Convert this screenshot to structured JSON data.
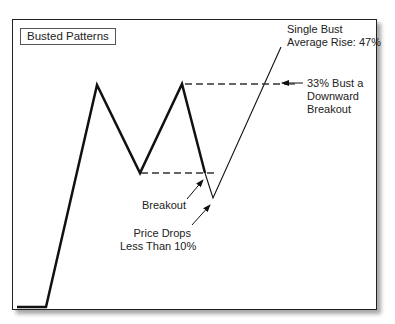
{
  "diagram": {
    "title": "Busted Patterns",
    "pattern_type": "Double Top (M shape)",
    "annotations": {
      "single_bust_line1": "Single Bust",
      "single_bust_line2": "Average Rise: 47%",
      "bust_line1": "33% Bust a",
      "bust_line2": "Downward",
      "bust_line3": "Breakout",
      "breakout": "Breakout",
      "price_drops_line1": "Price Drops",
      "price_drops_line2": "Less Than 10%"
    },
    "colors": {
      "line": "#111111",
      "frame": "#222222",
      "background": "#ffffff"
    }
  }
}
